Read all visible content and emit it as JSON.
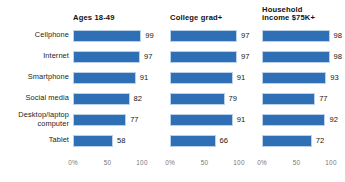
{
  "chart_data": {
    "type": "bar",
    "title": "",
    "subtitle": "",
    "xlabel": "",
    "ylabel": "",
    "xlim": [
      0,
      100
    ],
    "grid": false,
    "legend": "none",
    "orientation": "horizontal",
    "categories": [
      "Cellphone",
      "Internet",
      "Smartphone",
      "Social media",
      "Desktop/laptop computer",
      "Tablet"
    ],
    "category_lines": [
      [
        "Cellphone"
      ],
      [
        "Internet"
      ],
      [
        "Smartphone"
      ],
      [
        "Social media"
      ],
      [
        "Desktop/laptop",
        "computer"
      ],
      [
        "Tablet"
      ]
    ],
    "panels": [
      {
        "title": "Ages 18-49",
        "title_lines": [
          "Ages 18-49"
        ],
        "values": [
          99,
          97,
          91,
          82,
          77,
          58
        ],
        "value_labels": [
          "99",
          "97",
          "91",
          "82",
          "77",
          "58"
        ],
        "ticks": [
          "0%",
          "50",
          "100"
        ],
        "tick_values": [
          0,
          50,
          100
        ]
      },
      {
        "title": "College grad+",
        "title_lines": [
          "College grad+"
        ],
        "values": [
          97,
          97,
          91,
          79,
          91,
          66
        ],
        "value_labels": [
          "97",
          "97",
          "91",
          "79",
          "91",
          "66"
        ],
        "ticks": [
          "0%",
          "50",
          "100"
        ],
        "tick_values": [
          0,
          50,
          100
        ]
      },
      {
        "title": "Household income $75K+",
        "title_lines": [
          "Household",
          "income $75K+"
        ],
        "values": [
          98,
          98,
          93,
          77,
          92,
          72
        ],
        "value_labels": [
          "98",
          "98",
          "93",
          "77",
          "92",
          "72"
        ],
        "ticks": [
          "0%",
          "50",
          "100"
        ],
        "tick_values": [
          0,
          50,
          100
        ]
      }
    ],
    "colors": {
      "bar": "#2f6fb5",
      "bar_edge": "#b9d2ea",
      "text": "#1a1a1a",
      "tick_text": "#777777",
      "background": "#ffffff"
    }
  }
}
